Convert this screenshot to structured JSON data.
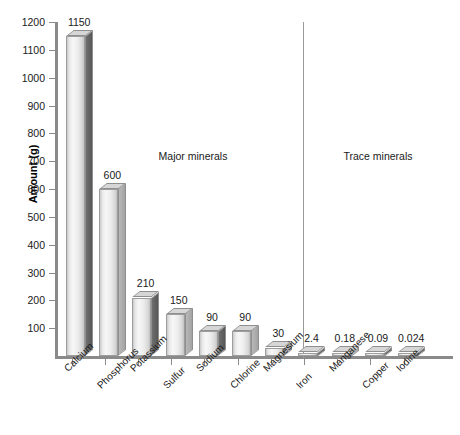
{
  "chart_data": {
    "type": "bar",
    "title": "",
    "xlabel": "",
    "ylabel": "Amount (g)",
    "ylim": [
      0,
      1200
    ],
    "ytick_labels": [
      "100",
      "200",
      "300",
      "400",
      "500",
      "600",
      "700",
      "800",
      "900",
      "1000",
      "1100",
      "1200"
    ],
    "ytick_values": [
      100,
      200,
      300,
      400,
      500,
      600,
      700,
      800,
      900,
      1000,
      1100,
      1200
    ],
    "grid": false,
    "legend": "none",
    "categories": [
      "Calcium",
      "Phosphorus",
      "Potassium",
      "Sulfur",
      "Sodium",
      "Chlorine",
      "Magnesium",
      "Iron",
      "Manganese",
      "Copper",
      "Iodine"
    ],
    "values": [
      1150,
      600,
      210,
      150,
      90,
      90,
      30,
      2.4,
      0.18,
      0.09,
      0.024
    ],
    "value_labels": [
      "1150",
      "600",
      "210",
      "150",
      "90",
      "90",
      "30",
      "2.4",
      "0.18",
      "0.09",
      "0.024"
    ],
    "annotations": [
      {
        "text": "Major minerals",
        "x_px": 193,
        "y_px": 150
      },
      {
        "text": "Trace minerals",
        "x_px": 378,
        "y_px": 150
      }
    ],
    "groups": [
      {
        "name": "Major minerals",
        "categories": [
          "Calcium",
          "Phosphorus",
          "Potassium",
          "Sulfur",
          "Sodium",
          "Chlorine",
          "Magnesium"
        ]
      },
      {
        "name": "Trace minerals",
        "categories": [
          "Iron",
          "Manganese",
          "Copper",
          "Iodine"
        ]
      }
    ],
    "bar_side_shade": [
      "dark",
      "light",
      "dark",
      "light",
      "dark",
      "light",
      "light",
      "dark",
      "light",
      "dark",
      "dark"
    ],
    "colors": {
      "axis": "#8a8a8a",
      "divider": "#9a9a9a",
      "bar_face_light": "#f2f2f2",
      "bar_side_dark": "#6f6f6f",
      "bar_side_light": "#b8b8b8",
      "bar_top": "#d6d6d6",
      "text": "#1a1a1a",
      "background": "#ffffff"
    }
  }
}
